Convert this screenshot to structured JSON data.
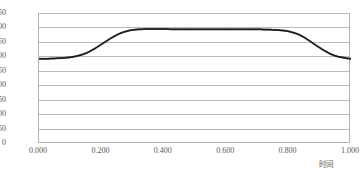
{
  "chart_data": {
    "type": "scatter",
    "title": "",
    "xlabel": "时间",
    "ylabel": "",
    "grid": true,
    "legend": false,
    "marker": "small-filled-square",
    "marker_color": "#1a1a1a",
    "xlim": [
      0.0,
      1.0
    ],
    "ylim": [
      0,
      450
    ],
    "xticks": [
      0.0,
      0.2,
      0.4,
      0.6,
      0.8,
      1.0
    ],
    "xtick_labels": [
      "0.000",
      "0.200",
      "0.400",
      "0.600",
      "0.800",
      "1.000"
    ],
    "yticks": [
      0,
      50,
      100,
      150,
      200,
      250,
      300,
      350,
      400,
      450
    ],
    "ytick_labels": [
      "0",
      "50",
      "100",
      "150",
      "200",
      "250",
      "300",
      "350",
      "400",
      "450"
    ],
    "series": [
      {
        "name": "series-1",
        "x": [
          0.0,
          0.01,
          0.02,
          0.03,
          0.04,
          0.05,
          0.06,
          0.07,
          0.08,
          0.09,
          0.1,
          0.11,
          0.12,
          0.13,
          0.14,
          0.15,
          0.16,
          0.17,
          0.18,
          0.19,
          0.2,
          0.21,
          0.22,
          0.23,
          0.24,
          0.25,
          0.26,
          0.27,
          0.28,
          0.29,
          0.3,
          0.31,
          0.32,
          0.33,
          0.34,
          0.35,
          0.36,
          0.37,
          0.38,
          0.39,
          0.4,
          0.41,
          0.42,
          0.43,
          0.44,
          0.45,
          0.46,
          0.47,
          0.48,
          0.49,
          0.5,
          0.51,
          0.52,
          0.53,
          0.54,
          0.55,
          0.56,
          0.57,
          0.58,
          0.59,
          0.6,
          0.61,
          0.62,
          0.63,
          0.64,
          0.65,
          0.66,
          0.67,
          0.68,
          0.69,
          0.7,
          0.71,
          0.72,
          0.73,
          0.74,
          0.75,
          0.76,
          0.77,
          0.78,
          0.79,
          0.8,
          0.81,
          0.82,
          0.83,
          0.84,
          0.85,
          0.86,
          0.87,
          0.88,
          0.89,
          0.9,
          0.91,
          0.92,
          0.93,
          0.94,
          0.95,
          0.96,
          0.97,
          0.98,
          0.99,
          1.0
        ],
        "y": [
          295,
          295,
          295,
          295,
          296,
          296,
          297,
          297,
          298,
          299,
          300,
          302,
          304,
          307,
          310,
          314,
          319,
          325,
          331,
          338,
          345,
          352,
          359,
          366,
          372,
          378,
          383,
          387,
          390,
          393,
          395,
          396,
          397,
          397,
          398,
          398,
          398,
          398,
          398,
          398,
          398,
          398,
          397,
          397,
          397,
          397,
          397,
          397,
          397,
          397,
          397,
          397,
          397,
          397,
          397,
          397,
          397,
          397,
          397,
          397,
          397,
          397,
          397,
          397,
          397,
          397,
          397,
          397,
          397,
          397,
          397,
          397,
          396,
          396,
          396,
          395,
          395,
          394,
          393,
          392,
          390,
          387,
          384,
          380,
          375,
          369,
          362,
          355,
          347,
          340,
          333,
          326,
          320,
          314,
          309,
          305,
          302,
          300,
          298,
          296,
          295
        ]
      }
    ]
  },
  "axis": {
    "x_title": "时间"
  }
}
